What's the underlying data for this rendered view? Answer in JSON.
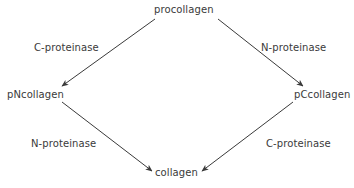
{
  "diagram": {
    "stroke_color": "#3a3a3a",
    "background_color": "#ffffff",
    "nodes": [
      {
        "id": "procollagen",
        "label": "procollagen"
      },
      {
        "id": "pncollagen",
        "label": "pNcollagen"
      },
      {
        "id": "pccollagen",
        "label": "pCcollagen"
      },
      {
        "id": "collagen",
        "label": "collagen"
      }
    ],
    "edges": [
      {
        "id": "top-left",
        "from": "procollagen",
        "to": "pncollagen",
        "label": "C-proteinase"
      },
      {
        "id": "top-right",
        "from": "procollagen",
        "to": "pccollagen",
        "label": "N-proteinase"
      },
      {
        "id": "bottom-left",
        "from": "pncollagen",
        "to": "collagen",
        "label": "N-proteinase"
      },
      {
        "id": "bottom-right",
        "from": "pccollagen",
        "to": "collagen",
        "label": "C-proteinase"
      }
    ]
  }
}
